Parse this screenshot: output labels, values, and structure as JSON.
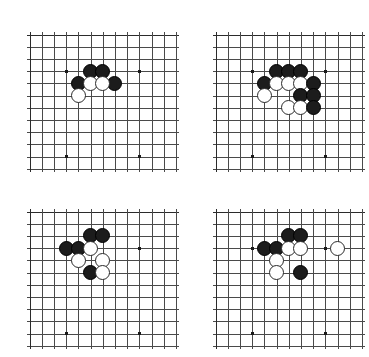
{
  "figure": {
    "type": "go-diagram-set",
    "width": 364,
    "height": 357,
    "background_color": "#ffffff",
    "line_color": "#4a4a4a",
    "edge_color": "#2b2b2b",
    "black_stone_color": "#1c1c1c",
    "white_stone_color": "#ffffff",
    "white_stone_border_color": "#2a2a2a",
    "hoshi_color": "#1a1a1a",
    "cell_size": 12.2,
    "stone_diameter": 15,
    "columns": 13,
    "rows": 12,
    "hoshi_points": [
      [
        3,
        3
      ],
      [
        9,
        3
      ],
      [
        3,
        10
      ],
      [
        9,
        10
      ]
    ]
  },
  "boards": [
    {
      "id": "board-top-left",
      "position": "top-left",
      "left": 22,
      "top": 27,
      "cols": 13,
      "rows": 12,
      "stones": [
        {
          "color": "black",
          "col": 5,
          "row": 3
        },
        {
          "color": "black",
          "col": 6,
          "row": 3
        },
        {
          "color": "black",
          "col": 4,
          "row": 4
        },
        {
          "color": "black",
          "col": 7,
          "row": 4
        },
        {
          "color": "white",
          "col": 5,
          "row": 4
        },
        {
          "color": "white",
          "col": 6,
          "row": 4
        },
        {
          "color": "white",
          "col": 4,
          "row": 5
        }
      ]
    },
    {
      "id": "board-top-right",
      "position": "top-right",
      "left": 208,
      "top": 27,
      "cols": 13,
      "rows": 12,
      "stones": [
        {
          "color": "black",
          "col": 5,
          "row": 3
        },
        {
          "color": "black",
          "col": 6,
          "row": 3
        },
        {
          "color": "black",
          "col": 7,
          "row": 3
        },
        {
          "color": "black",
          "col": 4,
          "row": 4
        },
        {
          "color": "white",
          "col": 5,
          "row": 4
        },
        {
          "color": "white",
          "col": 6,
          "row": 4
        },
        {
          "color": "white",
          "col": 7,
          "row": 4
        },
        {
          "color": "black",
          "col": 8,
          "row": 4
        },
        {
          "color": "white",
          "col": 4,
          "row": 5
        },
        {
          "color": "black",
          "col": 7,
          "row": 5
        },
        {
          "color": "black",
          "col": 8,
          "row": 5
        },
        {
          "color": "white",
          "col": 6,
          "row": 6
        },
        {
          "color": "white",
          "col": 7,
          "row": 6
        },
        {
          "color": "black",
          "col": 8,
          "row": 6
        }
      ]
    },
    {
      "id": "board-bottom-left",
      "position": "bottom-left",
      "left": 22,
      "top": 204,
      "cols": 13,
      "rows": 12,
      "stones": [
        {
          "color": "black",
          "col": 5,
          "row": 2
        },
        {
          "color": "black",
          "col": 6,
          "row": 2
        },
        {
          "color": "black",
          "col": 3,
          "row": 3
        },
        {
          "color": "black",
          "col": 4,
          "row": 3
        },
        {
          "color": "white",
          "col": 5,
          "row": 3
        },
        {
          "color": "white",
          "col": 4,
          "row": 4
        },
        {
          "color": "white",
          "col": 6,
          "row": 4
        },
        {
          "color": "black",
          "col": 5,
          "row": 5
        },
        {
          "color": "white",
          "col": 6,
          "row": 5
        }
      ]
    },
    {
      "id": "board-bottom-right",
      "position": "bottom-right",
      "left": 208,
      "top": 204,
      "cols": 13,
      "rows": 12,
      "stones": [
        {
          "color": "black",
          "col": 6,
          "row": 2
        },
        {
          "color": "black",
          "col": 7,
          "row": 2
        },
        {
          "color": "black",
          "col": 4,
          "row": 3
        },
        {
          "color": "black",
          "col": 5,
          "row": 3
        },
        {
          "color": "white",
          "col": 6,
          "row": 3
        },
        {
          "color": "white",
          "col": 7,
          "row": 3
        },
        {
          "color": "white",
          "col": 10,
          "row": 3
        },
        {
          "color": "white",
          "col": 5,
          "row": 4
        },
        {
          "color": "white",
          "col": 5,
          "row": 5
        },
        {
          "color": "black",
          "col": 7,
          "row": 5
        }
      ]
    }
  ]
}
